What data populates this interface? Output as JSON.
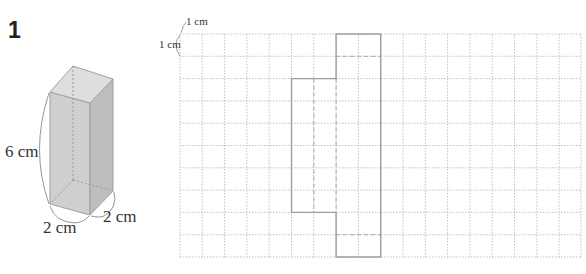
{
  "problem": {
    "number": "1"
  },
  "prism": {
    "type": "square-prism",
    "height_label": "6 cm",
    "width_label": "2 cm",
    "depth_label": "2 cm",
    "face_color": "#c8c8c8",
    "edge_color": "#9a9a9a"
  },
  "grid": {
    "unit_label_x": "1 cm",
    "unit_label_y": "1 cm",
    "columns": 18,
    "rows": 10,
    "cell_px": 22.3,
    "origin": [
      180,
      34
    ],
    "line_color": "#bdbdbd",
    "net": {
      "description": "Partial net of the prism: 2x2 top square, 4x6 middle band, 2x2 bottom square",
      "outline_color": "#9e9e9e"
    }
  }
}
